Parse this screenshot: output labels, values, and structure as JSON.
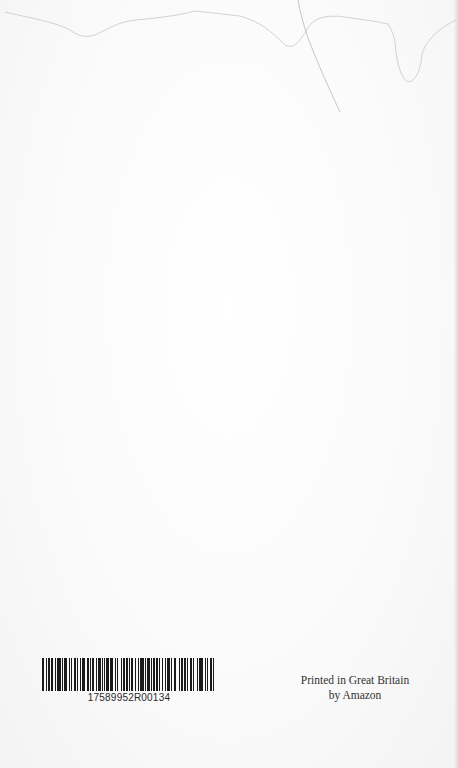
{
  "page": {
    "background_color": "#fbfbfb"
  },
  "barcode": {
    "number": "17589952R00134",
    "bar_color": "#1a1a1a",
    "pattern": [
      2,
      1,
      1,
      1,
      2,
      1,
      1,
      2,
      1,
      1,
      3,
      1,
      1,
      1,
      2,
      2,
      1,
      1,
      1,
      1,
      2,
      1,
      1,
      1,
      1,
      1,
      3,
      1,
      2,
      1,
      1,
      1,
      1,
      2,
      1,
      1,
      2,
      1,
      1,
      1,
      1,
      1,
      2,
      1,
      3,
      1,
      1,
      1,
      1,
      2,
      1,
      1,
      2,
      1,
      1,
      1,
      1,
      1,
      2,
      1,
      1,
      2,
      1,
      1,
      3,
      1,
      1,
      1,
      2,
      1,
      1,
      1,
      1,
      1,
      2,
      1,
      1,
      1,
      1,
      2,
      1,
      1,
      2,
      1,
      1,
      2,
      1,
      3,
      1,
      1,
      1,
      1,
      2,
      1,
      1,
      1,
      2,
      1,
      1,
      2,
      1,
      1,
      3,
      2,
      1,
      1,
      1,
      1,
      2,
      1,
      1,
      1
    ]
  },
  "imprint": {
    "line1": "Printed in Great Britain",
    "line2": "by Amazon"
  }
}
